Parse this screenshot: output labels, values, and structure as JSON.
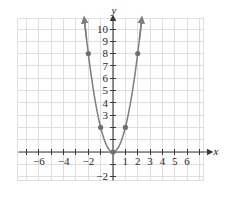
{
  "figure": {
    "axis_labels": {
      "x": "x",
      "y": "y"
    },
    "colors": {
      "grid": "#d6d6dc",
      "axis": "#3a3a3a",
      "curve": "#7d7d83",
      "point": "#6f6f75",
      "text": "#2b2b2b",
      "background": "#ffffff"
    }
  },
  "chart_data": {
    "type": "line",
    "title": "",
    "xlabel": "x",
    "ylabel": "y",
    "equation": "y = 2x^2",
    "grid": true,
    "legend": "none",
    "xlim": [
      -7.5,
      7.5
    ],
    "ylim": [
      -2.8,
      11.2
    ],
    "xticks": [
      -7,
      -6,
      -5,
      -4,
      -3,
      -2,
      -1,
      0,
      1,
      2,
      3,
      4,
      5,
      6,
      7
    ],
    "yticks": [
      -2,
      -1,
      0,
      1,
      2,
      3,
      4,
      5,
      6,
      7,
      8,
      9,
      10
    ],
    "xtick_labels": [
      {
        "value": -6,
        "text": "−6"
      },
      {
        "value": -4,
        "text": "−4"
      },
      {
        "value": -2,
        "text": "−2"
      },
      {
        "value": 1,
        "text": "1"
      },
      {
        "value": 2,
        "text": "2"
      },
      {
        "value": 3,
        "text": "3"
      },
      {
        "value": 4,
        "text": "4"
      },
      {
        "value": 5,
        "text": "5"
      },
      {
        "value": 6,
        "text": "6"
      }
    ],
    "ytick_labels": [
      {
        "value": 10,
        "text": "10"
      },
      {
        "value": 9,
        "text": "9"
      },
      {
        "value": 8,
        "text": "8"
      },
      {
        "value": 7,
        "text": "7"
      },
      {
        "value": 6,
        "text": "6"
      },
      {
        "value": 5,
        "text": "5"
      },
      {
        "value": 4,
        "text": "4"
      },
      {
        "value": 3,
        "text": "3"
      },
      {
        "value": -2,
        "text": "−2"
      }
    ],
    "series": [
      {
        "name": "y = 2x^2",
        "type": "parabola",
        "coefficient": 2,
        "vertex": [
          0,
          0
        ],
        "arrow_ends": true,
        "x": [
          -2.3,
          -2.2,
          -2.1,
          -2,
          -1.9,
          -1.8,
          -1.7,
          -1.6,
          -1.5,
          -1.4,
          -1.3,
          -1.2,
          -1.1,
          -1,
          -0.9,
          -0.8,
          -0.7,
          -0.6,
          -0.5,
          -0.4,
          -0.3,
          -0.2,
          -0.1,
          0,
          0.1,
          0.2,
          0.3,
          0.4,
          0.5,
          0.6,
          0.7,
          0.8,
          0.9,
          1,
          1.1,
          1.2,
          1.3,
          1.4,
          1.5,
          1.6,
          1.7,
          1.8,
          1.9,
          2,
          2.1,
          2.2,
          2.3
        ],
        "y": [
          10.58,
          9.68,
          8.82,
          8,
          7.22,
          6.48,
          5.78,
          5.12,
          4.5,
          3.92,
          3.38,
          2.88,
          2.42,
          2,
          1.62,
          1.28,
          0.98,
          0.72,
          0.5,
          0.32,
          0.18,
          0.08,
          0.02,
          0,
          0.02,
          0.08,
          0.18,
          0.32,
          0.5,
          0.72,
          0.98,
          1.28,
          1.62,
          2,
          2.42,
          2.88,
          3.38,
          3.92,
          4.5,
          5.12,
          5.78,
          6.48,
          7.22,
          8,
          8.82,
          9.68,
          10.58
        ]
      }
    ],
    "points": [
      {
        "x": -2,
        "y": 8,
        "label": "(-2, 8)"
      },
      {
        "x": -1,
        "y": 2,
        "label": "(-1, 2)"
      },
      {
        "x": 0,
        "y": 0,
        "label": "(0, 0)"
      },
      {
        "x": 1,
        "y": 2,
        "label": "(1, 2)"
      },
      {
        "x": 2,
        "y": 8,
        "label": "(2, 8)"
      }
    ]
  }
}
